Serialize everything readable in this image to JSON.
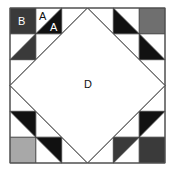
{
  "diagram": {
    "labels": {
      "B": "B",
      "A_top": "A",
      "A_bottom": "A",
      "D": "D"
    },
    "colors": {
      "black": "#111111",
      "dark_gray": "#3a3a3a",
      "mid_gray": "#6f6f6f",
      "light_gray": "#a8a8a8",
      "line": "#444444",
      "white": "#ffffff"
    },
    "grid": {
      "rows": 6,
      "cols": 6
    }
  }
}
